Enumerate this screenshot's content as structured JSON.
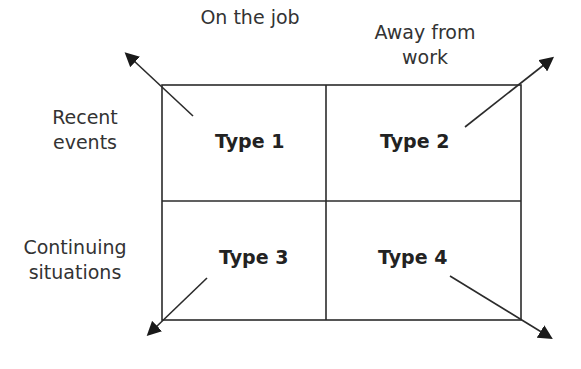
{
  "diagram": {
    "columns": [
      {
        "label_line1": "On the job",
        "label_line2": ""
      },
      {
        "label_line1": "Away from",
        "label_line2": "work"
      }
    ],
    "rows": [
      {
        "label_line1": "Recent",
        "label_line2": "events"
      },
      {
        "label_line1": "Continuing",
        "label_line2": "situations"
      }
    ],
    "cells": [
      {
        "label": "Type 1"
      },
      {
        "label": "Type 2"
      },
      {
        "label": "Type 3"
      },
      {
        "label": "Type 4"
      }
    ],
    "colors": {
      "line": "#2b2b2b",
      "arrow": "#1a1a1a",
      "text": "#333333"
    }
  }
}
